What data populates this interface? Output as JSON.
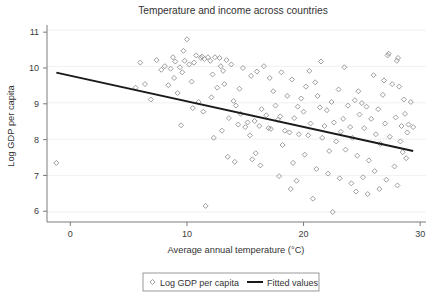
{
  "chart_data": {
    "type": "scatter",
    "title": "Temperature and income across countries",
    "xlabel": "Average annual temperature (°C)",
    "ylabel": "Log GDP per capita",
    "xlim": [
      -2.0,
      30.5
    ],
    "ylim": [
      5.7,
      11.2
    ],
    "xticks": [
      0,
      10,
      20,
      30
    ],
    "xtick_labels": [
      "0",
      "10",
      "20",
      "30"
    ],
    "yticks": [
      6,
      7,
      8,
      9,
      10,
      11
    ],
    "ytick_labels": [
      "6",
      "7",
      "8",
      "9",
      "10",
      "11"
    ],
    "grid": "horizontal",
    "legend_position": "below-axis-center",
    "legend": [
      {
        "label": "Log GDP per capita",
        "marker": "open-diamond",
        "color": "#8c8c8c"
      },
      {
        "label": "Fitted values",
        "marker": "line",
        "color": "#1a1a1a"
      }
    ],
    "series": [
      {
        "name": "Log GDP per capita",
        "marker": "open-diamond",
        "points": [
          [
            -1.2,
            7.35
          ],
          [
            5.6,
            9.45
          ],
          [
            6.0,
            10.15
          ],
          [
            6.4,
            9.55
          ],
          [
            6.9,
            9.12
          ],
          [
            7.4,
            10.22
          ],
          [
            7.8,
            9.95
          ],
          [
            8.1,
            10.05
          ],
          [
            8.4,
            9.52
          ],
          [
            8.6,
            9.98
          ],
          [
            8.8,
            10.3
          ],
          [
            9.0,
            10.18
          ],
          [
            9.2,
            9.3
          ],
          [
            9.4,
            10.02
          ],
          [
            9.5,
            8.4
          ],
          [
            9.7,
            10.48
          ],
          [
            9.8,
            10.2
          ],
          [
            10.0,
            10.8
          ],
          [
            10.2,
            10.1
          ],
          [
            10.4,
            9.62
          ],
          [
            10.6,
            10.15
          ],
          [
            10.8,
            10.35
          ],
          [
            11.0,
            9.05
          ],
          [
            11.2,
            10.28
          ],
          [
            11.3,
            10.32
          ],
          [
            11.5,
            10.25
          ],
          [
            11.6,
            6.15
          ],
          [
            11.8,
            10.3
          ],
          [
            12.0,
            10.2
          ],
          [
            12.2,
            9.82
          ],
          [
            12.4,
            10.3
          ],
          [
            12.6,
            9.45
          ],
          [
            12.8,
            10.28
          ],
          [
            13.0,
            8.25
          ],
          [
            13.2,
            9.55
          ],
          [
            13.4,
            10.22
          ],
          [
            13.6,
            8.6
          ],
          [
            13.8,
            10.1
          ],
          [
            14.0,
            9.08
          ],
          [
            14.2,
            8.95
          ],
          [
            14.4,
            8.42
          ],
          [
            14.6,
            8.72
          ],
          [
            14.8,
            10.0
          ],
          [
            15.0,
            8.35
          ],
          [
            15.2,
            8.48
          ],
          [
            15.4,
            8.12
          ],
          [
            15.6,
            7.45
          ],
          [
            15.8,
            8.52
          ],
          [
            16.0,
            9.9
          ],
          [
            16.2,
            8.38
          ],
          [
            16.4,
            8.85
          ],
          [
            16.6,
            10.05
          ],
          [
            16.8,
            8.68
          ],
          [
            17.0,
            8.32
          ],
          [
            17.2,
            8.3
          ],
          [
            17.4,
            9.35
          ],
          [
            17.6,
            8.95
          ],
          [
            17.8,
            8.55
          ],
          [
            18.0,
            8.65
          ],
          [
            18.2,
            7.85
          ],
          [
            18.4,
            8.25
          ],
          [
            18.6,
            9.22
          ],
          [
            18.8,
            8.2
          ],
          [
            19.0,
            9.68
          ],
          [
            19.2,
            8.6
          ],
          [
            19.4,
            6.85
          ],
          [
            19.6,
            8.15
          ],
          [
            19.8,
            9.15
          ],
          [
            20.0,
            8.78
          ],
          [
            20.2,
            9.48
          ],
          [
            20.4,
            8.12
          ],
          [
            20.6,
            8.45
          ],
          [
            20.8,
            6.35
          ],
          [
            21.0,
            9.6
          ],
          [
            21.2,
            9.22
          ],
          [
            21.4,
            8.9
          ],
          [
            21.6,
            8.05
          ],
          [
            21.8,
            8.38
          ],
          [
            22.0,
            8.82
          ],
          [
            22.2,
            7.68
          ],
          [
            22.4,
            9.05
          ],
          [
            22.6,
            8.48
          ],
          [
            22.8,
            7.95
          ],
          [
            23.0,
            9.4
          ],
          [
            23.2,
            8.22
          ],
          [
            23.4,
            8.58
          ],
          [
            23.6,
            7.72
          ],
          [
            23.8,
            8.95
          ],
          [
            24.0,
            8.35
          ],
          [
            24.2,
            8.05
          ],
          [
            24.4,
            9.1
          ],
          [
            24.6,
            7.55
          ],
          [
            24.8,
            8.7
          ],
          [
            25.0,
            9.02
          ],
          [
            25.2,
            8.32
          ],
          [
            25.4,
            8.92
          ],
          [
            25.6,
            7.42
          ],
          [
            25.8,
            8.58
          ],
          [
            26.0,
            9.8
          ],
          [
            26.2,
            8.15
          ],
          [
            26.4,
            8.85
          ],
          [
            26.6,
            7.88
          ],
          [
            26.8,
            9.25
          ],
          [
            27.0,
            8.45
          ],
          [
            27.2,
            10.35
          ],
          [
            27.3,
            10.4
          ],
          [
            27.4,
            8.08
          ],
          [
            27.6,
            9.55
          ],
          [
            27.8,
            7.25
          ],
          [
            27.9,
            8.62
          ],
          [
            28.0,
            10.2
          ],
          [
            28.1,
            10.28
          ],
          [
            28.2,
            9.48
          ],
          [
            28.3,
            7.95
          ],
          [
            28.4,
            8.38
          ],
          [
            28.5,
            7.65
          ],
          [
            28.6,
            9.12
          ],
          [
            28.7,
            8.72
          ],
          [
            28.8,
            7.48
          ],
          [
            28.9,
            8.2
          ],
          [
            29.0,
            8.42
          ],
          [
            12.3,
            8.05
          ],
          [
            13.5,
            7.52
          ],
          [
            14.1,
            7.38
          ],
          [
            15.9,
            7.62
          ],
          [
            16.3,
            7.28
          ],
          [
            17.1,
            9.72
          ],
          [
            19.1,
            7.35
          ],
          [
            20.1,
            7.58
          ],
          [
            21.1,
            7.18
          ],
          [
            22.1,
            7.05
          ],
          [
            23.1,
            6.92
          ],
          [
            24.1,
            6.78
          ],
          [
            25.1,
            6.95
          ],
          [
            26.1,
            7.12
          ],
          [
            27.1,
            6.88
          ],
          [
            28.05,
            6.72
          ],
          [
            22.5,
            5.98
          ],
          [
            24.5,
            6.55
          ],
          [
            25.5,
            6.48
          ],
          [
            26.5,
            6.62
          ],
          [
            10.5,
            8.88
          ],
          [
            11.4,
            8.78
          ],
          [
            12.1,
            9.18
          ],
          [
            13.1,
            9.92
          ],
          [
            9.6,
            9.88
          ],
          [
            8.9,
            9.72
          ],
          [
            12.9,
            10.05
          ],
          [
            14.5,
            9.42
          ],
          [
            15.5,
            9.78
          ],
          [
            18.1,
            9.88
          ],
          [
            19.5,
            8.92
          ],
          [
            20.5,
            9.92
          ],
          [
            21.5,
            10.18
          ],
          [
            23.5,
            10.02
          ],
          [
            24.7,
            9.35
          ],
          [
            26.9,
            9.65
          ],
          [
            29.2,
            9.05
          ],
          [
            29.4,
            8.35
          ],
          [
            18.9,
            6.62
          ],
          [
            17.9,
            6.98
          ]
        ]
      },
      {
        "name": "Fitted values",
        "type": "line",
        "x": [
          -1.2,
          29.4
        ],
        "y": [
          9.87,
          7.68
        ],
        "slope": -0.0715,
        "intercept": 9.78
      }
    ]
  }
}
